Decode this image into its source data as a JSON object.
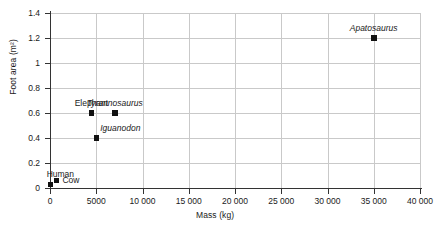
{
  "chart_data": {
    "type": "scatter",
    "title": "",
    "xlabel": "Mass (kg)",
    "ylabel": "Foot area (m²)",
    "xlim": [
      0,
      40000
    ],
    "ylim": [
      0,
      1.4
    ],
    "grid": true,
    "legend": "none",
    "x_ticks": [
      {
        "value": 0,
        "label": "0"
      },
      {
        "value": 5000,
        "label": "5000"
      },
      {
        "value": 10000,
        "label": "10 000"
      },
      {
        "value": 15000,
        "label": "15 000"
      },
      {
        "value": 20000,
        "label": "20 000"
      },
      {
        "value": 25000,
        "label": "25 000"
      },
      {
        "value": 30000,
        "label": "30 000"
      },
      {
        "value": 35000,
        "label": "35 000"
      },
      {
        "value": 40000,
        "label": "40 000"
      }
    ],
    "y_ticks": [
      {
        "value": 0,
        "label": "0"
      },
      {
        "value": 0.2,
        "label": "0.2"
      },
      {
        "value": 0.4,
        "label": "0.4"
      },
      {
        "value": 0.6,
        "label": "0.6"
      },
      {
        "value": 0.8,
        "label": "0.8"
      },
      {
        "value": 1.0,
        "label": "1"
      },
      {
        "value": 1.2,
        "label": "1.2"
      },
      {
        "value": 1.4,
        "label": "1.4"
      }
    ],
    "points": [
      {
        "name": "Human",
        "x": 70,
        "y": 0.03,
        "label": "Human",
        "italic": false,
        "label_pos": "above-left"
      },
      {
        "name": "Cow",
        "x": 700,
        "y": 0.06,
        "label": "Cow",
        "italic": false,
        "label_pos": "right"
      },
      {
        "name": "Elephant",
        "x": 4500,
        "y": 0.6,
        "label": "Elephant",
        "italic": false,
        "label_pos": "above"
      },
      {
        "name": "Iguanodon",
        "x": 5000,
        "y": 0.4,
        "label": "Iguanodon",
        "italic": true,
        "label_pos": "above-right"
      },
      {
        "name": "Tyrannosaurus",
        "x": 7000,
        "y": 0.6,
        "label": "Tyrannosaurus",
        "italic": true,
        "label_pos": "above"
      },
      {
        "name": "Apatosaurus",
        "x": 35000,
        "y": 1.2,
        "label": "Apatosaurus",
        "italic": true,
        "label_pos": "above"
      }
    ],
    "colors": {
      "marker": "#111111",
      "gridline": "#c9c9c9",
      "axis": "#333333",
      "text": "#1a1a1a",
      "background": "#ffffff"
    }
  }
}
